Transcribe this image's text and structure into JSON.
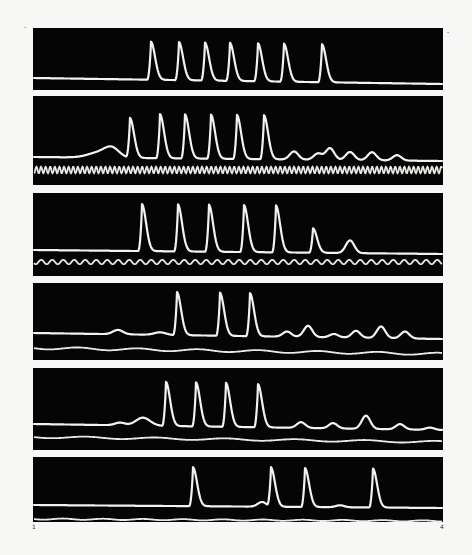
{
  "figure": {
    "frame": {
      "x0": 33,
      "x1": 443
    },
    "corner_marks": [
      {
        "x": 24,
        "y": 29,
        "label": "-"
      },
      {
        "x": 447,
        "y": 34,
        "label": "-"
      },
      {
        "x": 32,
        "y": 529,
        "label": "1"
      },
      {
        "x": 440,
        "y": 529,
        "label": "4"
      }
    ],
    "panels": [
      {
        "id": 1,
        "top": 28,
        "bottom": 90,
        "baseline": 78,
        "peak_top": 40,
        "start": 33,
        "end": 443,
        "drift": 6,
        "pre_bumps": [],
        "peaks": [
          {
            "x": 151,
            "h": 1.0
          },
          {
            "x": 179,
            "h": 1.0
          },
          {
            "x": 205,
            "h": 1.0
          },
          {
            "x": 230,
            "h": 1.0
          },
          {
            "x": 258,
            "h": 1.0
          },
          {
            "x": 284,
            "h": 1.0
          },
          {
            "x": 322,
            "h": 1.0
          }
        ],
        "ref": null
      },
      {
        "id": 2,
        "top": 96,
        "bottom": 185,
        "baseline": 157,
        "peak_top": 112,
        "start": 33,
        "end": 443,
        "drift": 4,
        "pre_bumps": [
          {
            "x": 100,
            "h": 0.12,
            "w": 16
          },
          {
            "x": 112,
            "h": 0.18,
            "w": 10
          }
        ],
        "peaks": [
          {
            "x": 130,
            "h": 0.88
          },
          {
            "x": 160,
            "h": 0.98
          },
          {
            "x": 185,
            "h": 0.98
          },
          {
            "x": 211,
            "h": 0.98
          },
          {
            "x": 237,
            "h": 0.98
          },
          {
            "x": 264,
            "h": 0.98
          },
          {
            "x": 294,
            "h": 0.18
          },
          {
            "x": 318,
            "h": 0.14
          },
          {
            "x": 330,
            "h": 0.26
          },
          {
            "x": 350,
            "h": 0.18
          },
          {
            "x": 372,
            "h": 0.18
          },
          {
            "x": 397,
            "h": 0.12
          }
        ],
        "ref": {
          "y": 170,
          "amp": 3.2,
          "period": 4.6,
          "type": "sine"
        }
      },
      {
        "id": 3,
        "top": 193,
        "bottom": 276,
        "baseline": 250,
        "peak_top": 203,
        "start": 33,
        "end": 443,
        "drift": 4,
        "pre_bumps": [],
        "peaks": [
          {
            "x": 142,
            "h": 1.0
          },
          {
            "x": 178,
            "h": 1.0
          },
          {
            "x": 209,
            "h": 1.0
          },
          {
            "x": 244,
            "h": 1.0
          },
          {
            "x": 276,
            "h": 1.0
          },
          {
            "x": 313,
            "h": 0.52
          },
          {
            "x": 350,
            "h": 0.27
          }
        ],
        "ref": {
          "y": 262,
          "amp": 2.2,
          "period": 11,
          "type": "sine"
        }
      },
      {
        "id": 4,
        "top": 283,
        "bottom": 360,
        "baseline": 333,
        "peak_top": 290,
        "start": 33,
        "end": 443,
        "drift": 6,
        "pre_bumps": [
          {
            "x": 118,
            "h": 0.1,
            "w": 7
          },
          {
            "x": 160,
            "h": 0.06,
            "w": 8
          }
        ],
        "peaks": [
          {
            "x": 177,
            "h": 1.0
          },
          {
            "x": 220,
            "h": 1.0
          },
          {
            "x": 250,
            "h": 1.0
          },
          {
            "x": 287,
            "h": 0.12
          },
          {
            "x": 308,
            "h": 0.26
          },
          {
            "x": 334,
            "h": 0.08
          },
          {
            "x": 356,
            "h": 0.16
          },
          {
            "x": 381,
            "h": 0.27
          },
          {
            "x": 405,
            "h": 0.16
          }
        ],
        "ref": {
          "y": 348,
          "amp": 1.2,
          "period": 60,
          "type": "drift",
          "slope": 6
        }
      },
      {
        "id": 5,
        "top": 368,
        "bottom": 450,
        "baseline": 424,
        "peak_top": 380,
        "start": 33,
        "end": 443,
        "drift": 6,
        "pre_bumps": [
          {
            "x": 120,
            "h": 0.06,
            "w": 7
          },
          {
            "x": 143,
            "h": 0.18,
            "w": 10
          }
        ],
        "peaks": [
          {
            "x": 166,
            "h": 1.0
          },
          {
            "x": 196,
            "h": 1.0
          },
          {
            "x": 226,
            "h": 1.0
          },
          {
            "x": 258,
            "h": 0.98
          },
          {
            "x": 301,
            "h": 0.13
          },
          {
            "x": 333,
            "h": 0.12
          },
          {
            "x": 366,
            "h": 0.3
          },
          {
            "x": 400,
            "h": 0.12
          },
          {
            "x": 430,
            "h": 0.05
          }
        ],
        "ref": {
          "y": 437,
          "amp": 1.0,
          "period": 70,
          "type": "drift",
          "slope": 5
        }
      },
      {
        "id": 6,
        "top": 457,
        "bottom": 522,
        "baseline": 505,
        "peak_top": 466,
        "start": 33,
        "end": 443,
        "drift": 3,
        "pre_bumps": [
          {
            "x": 262,
            "h": 0.12,
            "w": 6
          }
        ],
        "peaks": [
          {
            "x": 193,
            "h": 1.0
          },
          {
            "x": 271,
            "h": 1.0
          },
          {
            "x": 305,
            "h": 1.0
          },
          {
            "x": 340,
            "h": 0.05
          },
          {
            "x": 373,
            "h": 1.0
          }
        ],
        "ref": {
          "y": 519,
          "amp": 0.6,
          "period": 40,
          "type": "drift",
          "slope": 2
        }
      }
    ]
  }
}
